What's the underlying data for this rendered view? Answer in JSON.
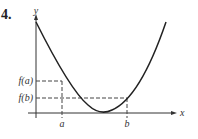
{
  "problem_number": "4.",
  "axes": {
    "x_label": "x",
    "y_label": "y"
  },
  "labels": {
    "fa": "f(a)",
    "fb": "f(b)",
    "a": "a",
    "b": "b"
  },
  "colors": {
    "curve": "#222222",
    "axis": "#333333",
    "dashed": "#444444"
  }
}
